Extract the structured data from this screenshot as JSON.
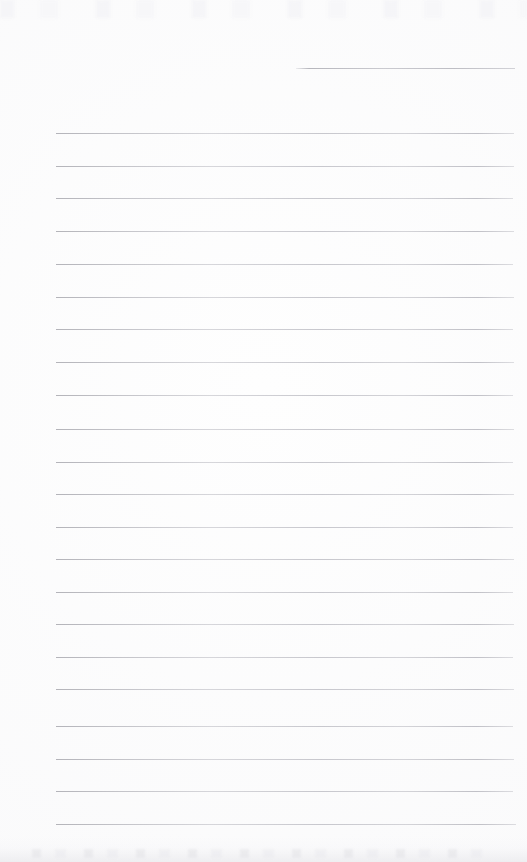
{
  "document": {
    "kind": "scanned-ruled-notebook-page",
    "title": "Blank ruled paper scan",
    "text_content": "",
    "width_px": 527,
    "height_px": 862
  },
  "colors": {
    "paper": "#fefefe",
    "rule_line": "#b8b8be",
    "page_tint": "#f7f7f9"
  },
  "ruling": {
    "line_count": 23,
    "left_x": 56,
    "right_x": 514,
    "spacing_px": 32.9,
    "first_full_line_y": 133,
    "last_line_y": 824,
    "partial_top_line": {
      "y": 68,
      "left_x": 296,
      "right_x": 515
    },
    "lines": [
      {
        "y": 68,
        "left": 296,
        "right": 515,
        "partial": true
      },
      {
        "y": 133,
        "left": 56,
        "right": 514,
        "partial": false
      },
      {
        "y": 166,
        "left": 56,
        "right": 514,
        "partial": false
      },
      {
        "y": 198,
        "left": 56,
        "right": 513,
        "partial": false
      },
      {
        "y": 231,
        "left": 56,
        "right": 514,
        "partial": false
      },
      {
        "y": 264,
        "left": 56,
        "right": 513,
        "partial": false
      },
      {
        "y": 297,
        "left": 56,
        "right": 514,
        "partial": false
      },
      {
        "y": 329,
        "left": 56,
        "right": 513,
        "partial": false
      },
      {
        "y": 362,
        "left": 56,
        "right": 514,
        "partial": false
      },
      {
        "y": 395,
        "left": 56,
        "right": 513,
        "partial": false
      },
      {
        "y": 429,
        "left": 56,
        "right": 514,
        "partial": false
      },
      {
        "y": 462,
        "left": 56,
        "right": 513,
        "partial": false
      },
      {
        "y": 494,
        "left": 56,
        "right": 514,
        "partial": false
      },
      {
        "y": 527,
        "left": 56,
        "right": 513,
        "partial": false
      },
      {
        "y": 559,
        "left": 56,
        "right": 514,
        "partial": false
      },
      {
        "y": 592,
        "left": 56,
        "right": 513,
        "partial": false
      },
      {
        "y": 624,
        "left": 56,
        "right": 514,
        "partial": false
      },
      {
        "y": 657,
        "left": 56,
        "right": 513,
        "partial": false
      },
      {
        "y": 689,
        "left": 56,
        "right": 514,
        "partial": false
      },
      {
        "y": 726,
        "left": 56,
        "right": 513,
        "partial": false
      },
      {
        "y": 759,
        "left": 56,
        "right": 514,
        "partial": false
      },
      {
        "y": 791,
        "left": 56,
        "right": 513,
        "partial": false
      },
      {
        "y": 824,
        "left": 56,
        "right": 516,
        "partial": false
      }
    ]
  }
}
